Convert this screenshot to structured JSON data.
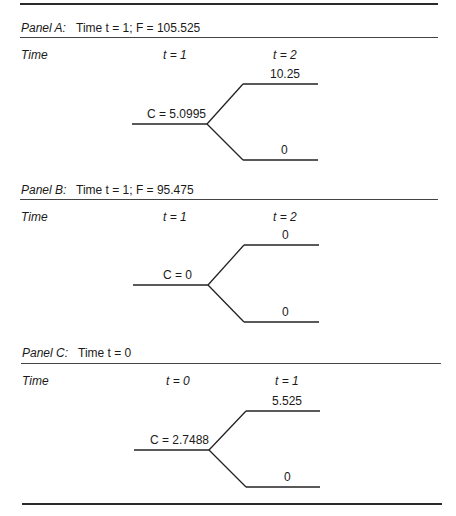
{
  "header": {
    "title_partial": "Contract at time..."
  },
  "panels": [
    {
      "id": "A",
      "label": "Panel A:",
      "title": "Time t = 1; F = 105.525",
      "col_time": "Time",
      "col_start": "t = 1",
      "col_end": "t = 2",
      "root_value": "C = 5.0995",
      "up_value": "10.25",
      "down_value": "0"
    },
    {
      "id": "B",
      "label": "Panel B:",
      "title": "Time t = 1; F = 95.475",
      "col_time": "Time",
      "col_start": "t = 1",
      "col_end": "t = 2",
      "root_value": "C = 0",
      "up_value": "0",
      "down_value": "0"
    },
    {
      "id": "C",
      "label": "Panel C:",
      "title": "Time t = 0",
      "col_time": "Time",
      "col_start": "t = 0",
      "col_end": "t = 1",
      "root_value": "C = 2.7488",
      "up_value": "5.525",
      "down_value": "0"
    }
  ]
}
